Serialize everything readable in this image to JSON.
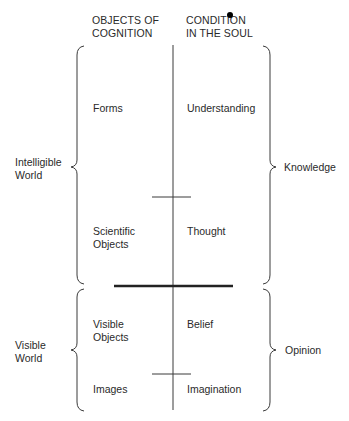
{
  "headers": {
    "objects": [
      "OBJECTS OF",
      "COGNITION"
    ],
    "condition": [
      "CONDITION",
      "IN THE SOUL"
    ]
  },
  "left_groups": {
    "intelligible": [
      "Intelligible",
      "World"
    ],
    "visible": [
      "Visible",
      "World"
    ]
  },
  "right_groups": {
    "knowledge": "Knowledge",
    "opinion": "Opinion"
  },
  "rows": [
    {
      "object": [
        "Forms"
      ],
      "condition": "Understanding"
    },
    {
      "object": [
        "Scientific",
        "Objects"
      ],
      "condition": "Thought"
    },
    {
      "object": [
        "Visible",
        "Objects"
      ],
      "condition": "Belief"
    },
    {
      "object": [
        "Images"
      ],
      "condition": "Imagination"
    }
  ],
  "colors": {
    "line": "#3a3a3a",
    "text": "#2a2a2a"
  }
}
